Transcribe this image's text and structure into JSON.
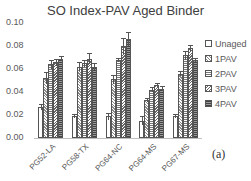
{
  "chart_data": {
    "type": "bar",
    "title": "SO Index-PAV Aged Binder",
    "xlabel": "",
    "ylabel": "",
    "ylim": [
      0,
      0.1
    ],
    "yticks": [
      "0.10",
      "0.08",
      "0.06",
      "0.04",
      "0.02",
      "0.00"
    ],
    "categories": [
      "PG52-LA",
      "PG58-TX",
      "PG64-NC",
      "PG64-MS",
      "PG67-MS"
    ],
    "series": [
      {
        "name": "Unaged",
        "values": [
          0.027,
          0.019,
          0.019,
          0.015,
          0.019
        ],
        "errors": [
          0.003,
          0.002,
          0.003,
          0.004,
          0.002
        ]
      },
      {
        "name": "1PAV",
        "values": [
          0.052,
          0.062,
          0.051,
          0.033,
          0.056
        ],
        "errors": [
          0.005,
          0.004,
          0.004,
          0.002,
          0.002
        ]
      },
      {
        "name": "2PAV",
        "values": [
          0.064,
          0.065,
          0.068,
          0.042,
          0.072
        ],
        "errors": [
          0.004,
          0.003,
          0.002,
          0.002,
          0.004
        ]
      },
      {
        "name": "3PAV",
        "values": [
          0.066,
          0.069,
          0.08,
          0.046,
          0.078
        ],
        "errors": [
          0.003,
          0.005,
          0.007,
          0.002,
          0.003
        ]
      },
      {
        "name": "4PAV",
        "values": [
          0.069,
          0.062,
          0.086,
          0.043,
          0.068
        ],
        "errors": [
          0.002,
          0.003,
          0.006,
          0.002,
          0.002
        ]
      }
    ],
    "legend_position": "right",
    "grid": false,
    "annotation": "(a)"
  },
  "colors": [
    "#ffffff",
    "#d9d9d9",
    "#a6a6a6",
    "#8c8c8c",
    "#595959"
  ]
}
